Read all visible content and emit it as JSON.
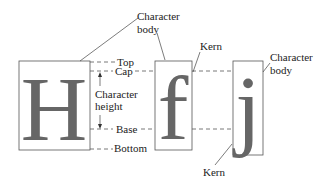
{
  "diagram": {
    "glyphs": [
      {
        "char": "H",
        "box": {
          "x": 19,
          "y": 61,
          "w": 71,
          "h": 89
        }
      },
      {
        "char": "f",
        "box": {
          "x": 155,
          "y": 61,
          "w": 37,
          "h": 89
        }
      },
      {
        "char": "j",
        "box": {
          "x": 233,
          "y": 61,
          "w": 30,
          "h": 94
        }
      }
    ],
    "labels": {
      "character_body_top_1": "Character",
      "character_body_top_2": "body",
      "kern_top": "Kern",
      "character_body_right_1": "Character",
      "character_body_right_2": "body",
      "top": "Top",
      "cap": "Cap",
      "character_height_1": "Character",
      "character_height_2": "height",
      "base": "Base",
      "bottom": "Bottom",
      "kern_bottom": "Kern"
    },
    "colors": {
      "glyph": "#666666",
      "lines": "#555555",
      "text": "#222222",
      "background": "#ffffff"
    }
  }
}
